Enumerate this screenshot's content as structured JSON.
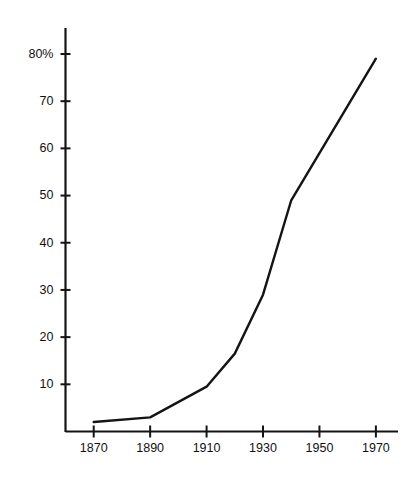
{
  "chart_data": {
    "type": "line",
    "title": "",
    "subtitle": "",
    "xlabel": "",
    "ylabel": "",
    "x": [
      1870,
      1890,
      1910,
      1920,
      1930,
      1940,
      1970
    ],
    "values": [
      2,
      3,
      9.5,
      16.5,
      29,
      49,
      79
    ],
    "series": [
      {
        "name": "",
        "x": [
          1870,
          1890,
          1910,
          1920,
          1930,
          1940,
          1970
        ],
        "values": [
          2,
          3,
          9.5,
          16.5,
          29,
          49,
          79
        ]
      }
    ],
    "xlim": [
      1860,
      1975
    ],
    "ylim": [
      0,
      85
    ],
    "xticks": [
      1870,
      1890,
      1910,
      1930,
      1950,
      1970
    ],
    "xtick_labels": [
      "1870",
      "1890",
      "1910",
      "1930",
      "1950",
      "1970"
    ],
    "yticks": [
      10,
      20,
      30,
      40,
      50,
      60,
      70,
      80
    ],
    "ytick_labels": [
      "10",
      "20",
      "30",
      "40",
      "50",
      "60",
      "70",
      "80%"
    ],
    "grid": false,
    "legend": null,
    "line_color": "#141414",
    "axis_color": "#141414",
    "background": "#ffffff"
  },
  "figure": {
    "caption": ""
  }
}
